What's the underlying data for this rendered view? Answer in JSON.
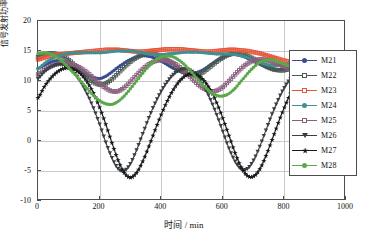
{
  "chart_data": {
    "type": "line",
    "title": "",
    "xlabel": "时间 / min",
    "ylabel": "信号发射功率/dBW",
    "xlim": [
      0,
      1000
    ],
    "ylim": [
      -10,
      20
    ],
    "xticks": [
      0,
      200,
      400,
      600,
      800,
      1000
    ],
    "yticks": [
      -10,
      -5,
      0,
      5,
      10,
      15,
      20
    ],
    "grid": true,
    "legend_position": "right",
    "x": [
      0,
      20,
      40,
      60,
      80,
      100,
      120,
      140,
      160,
      180,
      200,
      220,
      240,
      260,
      280,
      300,
      320,
      340,
      360,
      380,
      400,
      420,
      440,
      460,
      480,
      500,
      520,
      540,
      560,
      580,
      600,
      620,
      640,
      660,
      680,
      700,
      720,
      740,
      760,
      780,
      800,
      820,
      840,
      860,
      880
    ],
    "series": [
      {
        "name": "M21",
        "color": "#3b4a92",
        "marker": "circle",
        "values": [
          12.1,
          12.6,
          13.1,
          13.4,
          13.3,
          12.9,
          12.4,
          11.7,
          11.0,
          10.6,
          10.4,
          10.8,
          11.5,
          12.3,
          13.0,
          13.6,
          14.0,
          14.2,
          14.1,
          13.8,
          13.3,
          12.7,
          12.1,
          11.6,
          11.3,
          11.2,
          11.5,
          12.0,
          12.7,
          13.4,
          14.0,
          14.3,
          14.4,
          14.2,
          13.8,
          13.3,
          12.8,
          12.3,
          12.0,
          11.9,
          12.0,
          12.3,
          12.7,
          13.0,
          13.2
        ]
      },
      {
        "name": "M22",
        "color": "#4a5a52",
        "marker": "square",
        "values": [
          14.0,
          14.4,
          14.6,
          14.5,
          14.1,
          13.5,
          12.6,
          11.6,
          10.6,
          9.8,
          9.4,
          9.6,
          10.3,
          11.3,
          12.3,
          13.2,
          13.9,
          14.4,
          14.6,
          14.5,
          14.1,
          13.5,
          12.7,
          11.9,
          11.3,
          11.0,
          11.1,
          11.6,
          12.4,
          13.2,
          13.9,
          14.4,
          14.6,
          14.5,
          14.2,
          13.7,
          13.1,
          12.5,
          12.0,
          11.8,
          11.8,
          12.1,
          12.5,
          12.9,
          13.2
        ]
      },
      {
        "name": "M23",
        "color": "#e8553a",
        "marker": "square",
        "values": [
          13.6,
          13.9,
          14.2,
          14.4,
          14.5,
          14.6,
          14.7,
          14.8,
          14.9,
          15.0,
          15.1,
          15.2,
          15.2,
          15.2,
          15.1,
          15.0,
          14.9,
          14.9,
          15.0,
          15.1,
          15.2,
          15.3,
          15.3,
          15.3,
          15.2,
          15.1,
          15.0,
          14.9,
          14.9,
          15.0,
          15.1,
          15.2,
          15.2,
          15.1,
          15.0,
          14.8,
          14.6,
          14.3,
          14.0,
          13.7,
          13.4,
          13.2,
          13.0,
          12.9,
          12.8
        ]
      },
      {
        "name": "M24",
        "color": "#3f8f93",
        "marker": "circle",
        "values": [
          12.0,
          12.9,
          13.6,
          14.1,
          14.4,
          14.6,
          14.7,
          14.7,
          14.7,
          14.7,
          14.7,
          14.8,
          14.9,
          15.0,
          15.0,
          15.0,
          14.9,
          14.7,
          14.5,
          14.4,
          14.4,
          14.5,
          14.6,
          14.7,
          14.8,
          14.8,
          14.8,
          14.7,
          14.6,
          14.5,
          14.5,
          14.5,
          14.4,
          14.2,
          13.9,
          13.5,
          13.1,
          12.8,
          12.6,
          12.6,
          12.7,
          12.9,
          13.0,
          13.1,
          13.1
        ]
      },
      {
        "name": "M25",
        "color": "#8a5f7d",
        "marker": "square",
        "values": [
          11.1,
          11.8,
          12.4,
          12.8,
          13.0,
          12.9,
          12.6,
          12.1,
          11.4,
          10.5,
          9.6,
          8.8,
          8.3,
          8.3,
          8.9,
          9.9,
          11.0,
          12.0,
          12.8,
          13.3,
          13.5,
          13.4,
          13.0,
          12.3,
          11.4,
          10.4,
          9.4,
          8.7,
          8.3,
          8.4,
          9.0,
          10.0,
          11.1,
          12.1,
          12.9,
          13.4,
          13.6,
          13.5,
          13.2,
          12.8,
          12.4,
          12.2,
          12.1,
          12.2,
          12.4
        ]
      },
      {
        "name": "M26",
        "color": "#3a3f45",
        "marker": "tri-down",
        "values": [
          10.4,
          11.5,
          12.3,
          12.7,
          12.7,
          12.2,
          11.2,
          9.7,
          7.8,
          5.5,
          2.8,
          -0.2,
          -2.8,
          -4.6,
          -5.0,
          -3.8,
          -1.5,
          1.2,
          3.9,
          6.3,
          8.3,
          9.9,
          11.1,
          11.8,
          12.0,
          11.6,
          10.6,
          9.0,
          6.9,
          4.4,
          1.6,
          -1.2,
          -3.4,
          -4.7,
          -4.6,
          -3.2,
          -0.9,
          1.8,
          4.5,
          6.9,
          8.9,
          10.4,
          11.5,
          12.1,
          12.3
        ]
      },
      {
        "name": "M27",
        "color": "#1a1a1a",
        "marker": "star",
        "values": [
          7.2,
          9.0,
          10.4,
          11.4,
          12.0,
          12.2,
          11.9,
          11.1,
          9.8,
          8.0,
          5.6,
          2.8,
          -0.3,
          -3.2,
          -5.3,
          -6.1,
          -5.3,
          -3.4,
          -0.9,
          1.8,
          4.4,
          6.7,
          8.6,
          10.0,
          10.9,
          11.2,
          10.9,
          10.0,
          8.5,
          6.4,
          3.8,
          0.9,
          -2.0,
          -4.4,
          -5.8,
          -5.9,
          -4.7,
          -2.5,
          0.2,
          3.0,
          5.6,
          7.9,
          9.7,
          11.0,
          11.7
        ]
      },
      {
        "name": "M28",
        "color": "#5aa84a",
        "marker": "circle",
        "values": [
          14.6,
          14.7,
          14.5,
          14.0,
          13.2,
          12.2,
          11.1,
          9.9,
          8.7,
          7.6,
          6.7,
          6.2,
          6.1,
          6.6,
          7.5,
          8.7,
          10.0,
          11.3,
          12.5,
          13.4,
          14.0,
          14.2,
          14.0,
          13.4,
          12.5,
          11.4,
          10.2,
          9.1,
          8.2,
          7.6,
          7.5,
          7.9,
          8.8,
          10.0,
          11.2,
          12.3,
          13.1,
          13.5,
          13.5,
          13.2,
          12.8,
          12.5,
          12.3,
          12.3,
          12.5
        ]
      }
    ]
  }
}
